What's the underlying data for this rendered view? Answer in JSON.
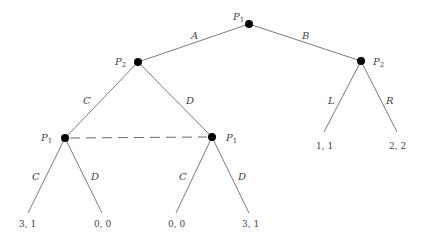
{
  "diagram": {
    "type": "extensive-form game tree",
    "nodes": {
      "root": {
        "player": "P",
        "sub": "1"
      },
      "left": {
        "player": "P",
        "sub": "2"
      },
      "right": {
        "player": "P",
        "sub": "2"
      },
      "ll": {
        "player": "P",
        "sub": "1"
      },
      "lr": {
        "player": "P",
        "sub": "1"
      }
    },
    "edges": {
      "A": "A",
      "B": "B",
      "C1": "C",
      "D1": "D",
      "L": "L",
      "R": "R",
      "C2": "C",
      "D2": "D",
      "C3": "C",
      "D3": "D"
    },
    "payoffs": {
      "p1": "3, 1",
      "p2": "0, 0",
      "p3": "0, 0",
      "p4": "3, 1",
      "p5": "1, 1",
      "p6": "2, 2"
    },
    "information_set": "dashed line joining the two P1 nodes"
  }
}
